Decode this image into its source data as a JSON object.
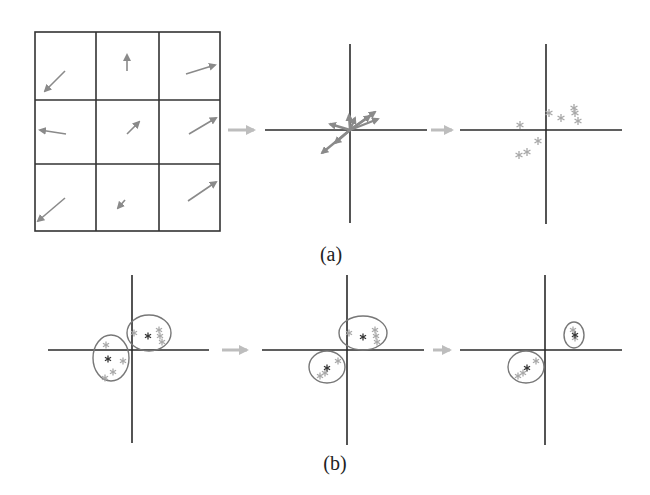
{
  "colors": {
    "grid": "#333333",
    "axis": "#2a2a2a",
    "vector": "#8a8a8a",
    "flow_arrow": "#bdbdbd",
    "point_light": "#a8a8a8",
    "point_dark": "#333333",
    "ellipse": "#777777"
  },
  "panel_a": {
    "label": "(a)",
    "grid": {
      "x": [
        35,
        96,
        159,
        220
      ],
      "y": [
        32,
        100,
        164,
        231
      ],
      "vectors": [
        {
          "cell": "r0c0",
          "from": [
            65,
            71
          ],
          "to": [
            45,
            91
          ]
        },
        {
          "cell": "r0c1",
          "from": [
            127,
            71
          ],
          "to": [
            127,
            55
          ]
        },
        {
          "cell": "r0c2",
          "from": [
            186,
            74
          ],
          "to": [
            215,
            65
          ]
        },
        {
          "cell": "r1c0",
          "from": [
            66,
            134
          ],
          "to": [
            40,
            130
          ]
        },
        {
          "cell": "r1c1",
          "from": [
            127,
            134
          ],
          "to": [
            139,
            122
          ]
        },
        {
          "cell": "r1c2",
          "from": [
            189,
            134
          ],
          "to": [
            216,
            118
          ]
        },
        {
          "cell": "r2c0",
          "from": [
            65,
            198
          ],
          "to": [
            38,
            221
          ]
        },
        {
          "cell": "r2c1",
          "from": [
            125,
            200
          ],
          "to": [
            118,
            208
          ]
        },
        {
          "cell": "r2c2",
          "from": [
            188,
            201
          ],
          "to": [
            216,
            182
          ]
        }
      ]
    },
    "flow_arrows": [
      {
        "from": [
          228,
          130
        ],
        "to": [
          260,
          130
        ]
      },
      {
        "from": [
          431,
          130
        ],
        "to": [
          458,
          130
        ]
      }
    ],
    "vector_plot": {
      "axis_x": {
        "y": 130,
        "x1": 265,
        "x2": 427
      },
      "axis_y": {
        "x": 350,
        "y1": 44,
        "y2": 223
      },
      "vectors": [
        {
          "from": [
            350,
            130
          ],
          "to": [
            330,
            124
          ]
        },
        {
          "from": [
            350,
            130
          ],
          "to": [
            349,
            115
          ]
        },
        {
          "from": [
            350,
            130
          ],
          "to": [
            375,
            112
          ]
        },
        {
          "from": [
            350,
            130
          ],
          "to": [
            378,
            119
          ]
        },
        {
          "from": [
            350,
            130
          ],
          "to": [
            355,
            118
          ]
        },
        {
          "from": [
            350,
            130
          ],
          "to": [
            322,
            153
          ]
        },
        {
          "from": [
            350,
            130
          ],
          "to": [
            335,
            143
          ]
        },
        {
          "from": [
            350,
            130
          ],
          "to": [
            370,
            116
          ]
        }
      ]
    },
    "scatter_plot": {
      "axis_x": {
        "y": 130,
        "x1": 460,
        "x2": 622
      },
      "axis_y": {
        "x": 546,
        "y1": 44,
        "y2": 224
      },
      "points": [
        [
          520,
          125
        ],
        [
          549,
          113
        ],
        [
          561,
          118
        ],
        [
          574,
          108
        ],
        [
          575,
          113
        ],
        [
          578,
          121
        ],
        [
          538,
          141
        ],
        [
          527,
          152
        ],
        [
          519,
          155
        ]
      ]
    }
  },
  "panel_b": {
    "label": "(b)",
    "flow_arrows": [
      {
        "from": [
          222,
          350
        ],
        "to": [
          253,
          350
        ]
      },
      {
        "from": [
          433,
          350
        ],
        "to": [
          456,
          350
        ]
      }
    ],
    "plots": [
      {
        "name": "iteration-1",
        "axis_x": {
          "y": 350,
          "x1": 48,
          "x2": 209
        },
        "axis_y": {
          "x": 132,
          "y1": 275,
          "y2": 443
        },
        "ellipses": [
          {
            "cx": 111,
            "cy": 358,
            "rx": 18,
            "ry": 23
          },
          {
            "cx": 149,
            "cy": 333,
            "rx": 22,
            "ry": 18
          }
        ],
        "points_light": [
          [
            106,
            345
          ],
          [
            123,
            361
          ],
          [
            113,
            372
          ],
          [
            105,
            378
          ],
          [
            134,
            333
          ],
          [
            159,
            330
          ],
          [
            160,
            336
          ],
          [
            162,
            342
          ]
        ],
        "points_dark": [
          [
            108,
            359
          ],
          [
            148,
            336
          ]
        ]
      },
      {
        "name": "iteration-2",
        "axis_x": {
          "y": 350,
          "x1": 262,
          "x2": 424
        },
        "axis_y": {
          "x": 347,
          "y1": 275,
          "y2": 445
        },
        "ellipses": [
          {
            "cx": 363,
            "cy": 333,
            "rx": 24,
            "ry": 17
          },
          {
            "cx": 327,
            "cy": 367,
            "rx": 18,
            "ry": 16
          }
        ],
        "points_light": [
          [
            349,
            333
          ],
          [
            375,
            330
          ],
          [
            376,
            336
          ],
          [
            377,
            342
          ],
          [
            338,
            361
          ],
          [
            320,
            376
          ],
          [
            325,
            373
          ]
        ],
        "points_dark": [
          [
            363,
            337
          ],
          [
            327,
            368
          ]
        ]
      },
      {
        "name": "iteration-3",
        "axis_x": {
          "y": 350,
          "x1": 460,
          "x2": 622
        },
        "axis_y": {
          "x": 545,
          "y1": 275,
          "y2": 445
        },
        "ellipses": [
          {
            "cx": 574,
            "cy": 335,
            "rx": 10,
            "ry": 13
          },
          {
            "cx": 526,
            "cy": 367,
            "rx": 18,
            "ry": 16
          }
        ],
        "points_light": [
          [
            573,
            330
          ],
          [
            575,
            338
          ],
          [
            536,
            361
          ],
          [
            518,
            376
          ],
          [
            523,
            373
          ]
        ],
        "points_dark": [
          [
            575,
            335
          ],
          [
            527,
            368
          ]
        ]
      }
    ]
  }
}
